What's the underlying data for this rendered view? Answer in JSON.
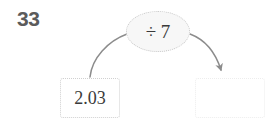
{
  "page": {
    "background_color": "#ffffff",
    "width": 271,
    "height": 121
  },
  "question": {
    "number": "33"
  },
  "function_machine": {
    "input": {
      "value": "2.03",
      "placeholder": ""
    },
    "operation": {
      "label": "÷ 7",
      "operator": "÷",
      "operand": "7"
    },
    "output": {
      "value": "",
      "placeholder": ""
    },
    "arrows": {
      "input_to_operation": "curved-arc",
      "operation_to_output": "curved-arrow"
    }
  },
  "colors": {
    "number_text": "#5b5b5b",
    "value_text": "#3a3a3a",
    "arrow_stroke": "#8c8c8c",
    "box_border": "#d0d0d0",
    "output_box_border": "#ededed",
    "ellipse_fill": "#f7f7f7",
    "ellipse_border": "#c9c9c9"
  }
}
